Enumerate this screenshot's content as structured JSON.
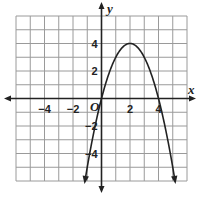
{
  "chart_data": {
    "type": "line",
    "title": "",
    "function": "y = -x^2 + 4x",
    "xlabel": "x",
    "ylabel": "y",
    "origin_label": "O",
    "xlim": [
      -6,
      6
    ],
    "ylim": [
      -6,
      6
    ],
    "grid": true,
    "grid_step": 1,
    "x_tick_labels": [
      {
        "value": -4,
        "label": "−4"
      },
      {
        "value": -2,
        "label": "−2"
      },
      {
        "value": 2,
        "label": "2"
      },
      {
        "value": 4,
        "label": "4"
      }
    ],
    "y_tick_labels": [
      {
        "value": 4,
        "label": "4"
      },
      {
        "value": 2,
        "label": "2"
      },
      {
        "value": -2,
        "label": "−2"
      },
      {
        "value": -4,
        "label": "−4"
      }
    ],
    "series": [
      {
        "name": "parabola",
        "x": [
          -1.16,
          -1,
          0,
          1,
          2,
          3,
          4,
          5,
          5.16
        ],
        "y": [
          -6,
          -5,
          0,
          3,
          4,
          3,
          0,
          -5,
          -6
        ],
        "vertex": [
          2,
          4
        ],
        "x_intercepts": [
          0,
          4
        ],
        "arrows_at_ends": true
      }
    ],
    "colors": {
      "grid": "#9a9a9a",
      "axis": "#222222",
      "curve": "#222222"
    }
  }
}
